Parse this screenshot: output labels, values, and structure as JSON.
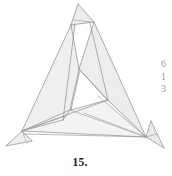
{
  "figure": {
    "caption": "15.",
    "title": "15.",
    "style": {
      "background": "#ffffff",
      "fill_light": "#f2f2f2",
      "fill_mid": "#e8e8e8",
      "fill_pale": "#f7f7f7",
      "stroke": "#8b8b8b",
      "stroke_dark": "#6f6f6f",
      "stroke_width": "0.7"
    },
    "vertices": {
      "apex_top": [
        78,
        4
      ],
      "apex_right": [
        94,
        22
      ],
      "left_vertex": [
        22,
        131
      ],
      "right_vertex": [
        146,
        137
      ],
      "inner_top": [
        79,
        69
      ],
      "inner_left": [
        70,
        110
      ],
      "inner_right": [
        108,
        100
      ],
      "bottom_left_flap": [
        6,
        146
      ],
      "bottom_right_flap": [
        164,
        148
      ]
    },
    "faces": [
      {
        "name": "apex-flap",
        "points": "78,4 94,22 71,25",
        "fill": "#ececec"
      },
      {
        "name": "left-large-panel",
        "points": "78,4 71,25 22,131 63,120",
        "fill": "#f1f1f1"
      },
      {
        "name": "left-strip",
        "points": "71,25 79,69 70,110 63,120 22,131",
        "fill": "#efefef"
      },
      {
        "name": "right-large-panel",
        "points": "94,22 146,137 108,100 79,69",
        "fill": "#f0f0f0"
      },
      {
        "name": "right-strip",
        "points": "94,22 79,69 108,100 146,137",
        "fill": "#ededed"
      },
      {
        "name": "bottom-panel",
        "points": "22,131 70,110 108,100 146,137",
        "fill": "#f3f3f3"
      },
      {
        "name": "inner-hole",
        "points": "79,69 70,110 108,100",
        "fill": "#ffffff"
      },
      {
        "name": "left-corner-flap",
        "points": "22,131 6,146 30,140",
        "fill": "#eeeeee"
      },
      {
        "name": "right-corner-flap",
        "points": "146,137 164,148 150,122",
        "fill": "#eaeaea"
      }
    ],
    "margin_text": {
      "note": "partially cropped digits from adjacent column",
      "lines": [
        "6",
        "1",
        "3"
      ]
    }
  }
}
